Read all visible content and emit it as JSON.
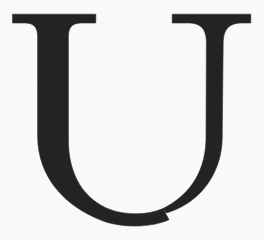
{
  "image": {
    "kind": "scanned-letterform",
    "glyph": "U",
    "script": "Latin",
    "case": "uppercase",
    "typeface_style": "serif",
    "width": 264,
    "height": 240,
    "alt_text": "U"
  },
  "colors": {
    "background": "#fcfbfa",
    "ink": "#242323",
    "ink_edge": "#2f2e2e"
  },
  "geometry": {
    "top_serif_y": 14,
    "serif_thickness": 9,
    "left_serif_x1": 12,
    "left_serif_x2": 96,
    "right_serif_x1": 172,
    "right_serif_x2": 251,
    "left_stem_x1": 37,
    "left_stem_x2": 68,
    "right_stem_x1": 206,
    "right_stem_x2": 222,
    "bowl_bottom_y": 224,
    "bowl_left_x": 22,
    "bowl_right_x": 242
  }
}
